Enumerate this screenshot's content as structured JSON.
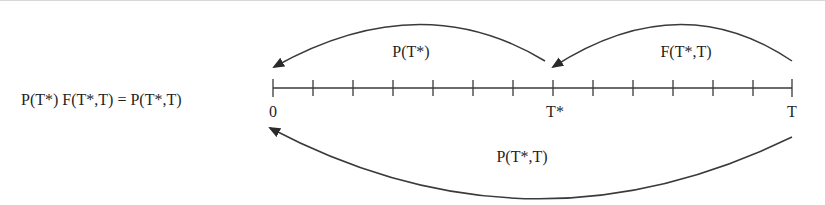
{
  "diagram": {
    "equation": "P(T*) F(T*,T) = P(T*,T)",
    "axis": {
      "ticks": 14,
      "labels": {
        "start": "0",
        "mid": "T*",
        "end": "T"
      }
    },
    "arrows": [
      {
        "id": "p-tstar",
        "label": "P(T*)",
        "from": "T*",
        "to": "0",
        "position": "above"
      },
      {
        "id": "f-tstar-t",
        "label": "F(T*,T)",
        "from": "T",
        "to": "T*",
        "position": "above"
      },
      {
        "id": "p-tstar-t",
        "label": "P(T*,T)",
        "from": "T",
        "to": "0",
        "position": "below"
      }
    ],
    "colors": {
      "line": "#3a3a3a",
      "text": "#1f1f1f",
      "background": "#ffffff"
    }
  }
}
